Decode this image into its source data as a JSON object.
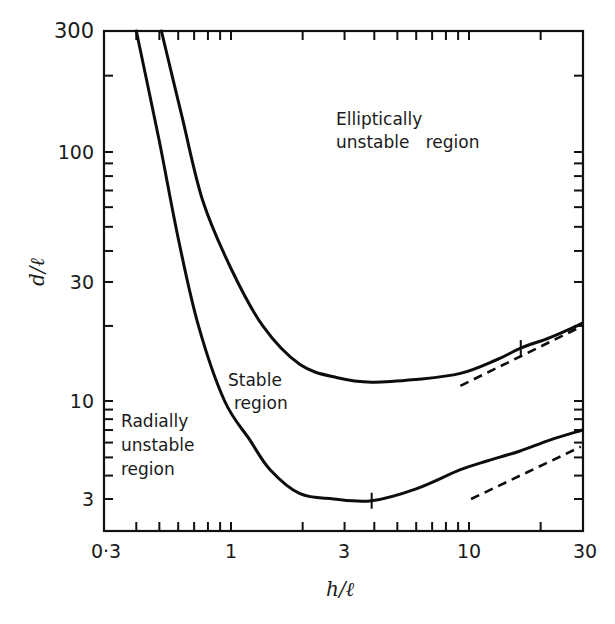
{
  "chart_data": {
    "type": "line",
    "title": "",
    "xlabel": "h/ℓ",
    "ylabel": "d/ℓ",
    "xscale": "log",
    "yscale": "log",
    "xlim": [
      0.3,
      30
    ],
    "ylim": [
      2.2,
      300
    ],
    "grid": false,
    "x_ticks": [
      {
        "value": 0.3,
        "label": "0·3"
      },
      {
        "value": 1,
        "label": "1"
      },
      {
        "value": 3,
        "label": "3"
      },
      {
        "value": 10,
        "label": "10"
      },
      {
        "value": 30,
        "label": "30"
      }
    ],
    "y_ticks": [
      {
        "value": 3,
        "label": "3"
      },
      {
        "value": 10,
        "label": "10"
      },
      {
        "value": 30,
        "label": "30"
      },
      {
        "value": 100,
        "label": "100"
      },
      {
        "value": 300,
        "label": "300"
      }
    ],
    "series": [
      {
        "name": "Elliptic stability boundary (upper curve)",
        "style": "solid",
        "x": [
          0.51,
          0.62,
          0.76,
          1.0,
          1.36,
          1.95,
          2.8,
          3.9,
          6.0,
          9.2,
          13.0,
          16.5,
          22.0,
          30.0
        ],
        "y": [
          300,
          140,
          64,
          34,
          20,
          14,
          12.4,
          11.9,
          12.2,
          12.9,
          14.6,
          16.3,
          18.0,
          20.5
        ],
        "marker_at": {
          "x": 16.5,
          "y": 16.3
        }
      },
      {
        "name": "Radial stability boundary (lower curve)",
        "style": "solid",
        "x": [
          0.4,
          0.5,
          0.6,
          0.73,
          0.94,
          1.2,
          1.46,
          1.95,
          2.7,
          3.9,
          6.0,
          9.2,
          12.0,
          16.3,
          22.0,
          30.0
        ],
        "y": [
          300,
          110,
          45,
          20,
          10,
          6.2,
          4.3,
          3.2,
          3.0,
          2.95,
          3.4,
          4.3,
          4.8,
          5.4,
          6.2,
          7.0
        ],
        "marker_at": {
          "x": 3.9,
          "y": 2.95
        }
      },
      {
        "name": "Upper asymptote",
        "style": "dashed",
        "x": [
          9.2,
          30.0
        ],
        "y": [
          11.5,
          20.0
        ]
      },
      {
        "name": "Lower asymptote",
        "style": "dashed",
        "x": [
          10.2,
          29.5
        ],
        "y": [
          3.0,
          5.7
        ]
      }
    ],
    "annotations": [
      {
        "text": [
          "Elliptically",
          "unstable region"
        ],
        "x": 4.5,
        "y": 110
      },
      {
        "text": [
          "Stable",
          "region"
        ],
        "x": 1.0,
        "y": 9
      },
      {
        "text": [
          "Radially",
          "unstable",
          "region"
        ],
        "x": 0.33,
        "y": 5
      }
    ]
  },
  "labels": {
    "x_axis_title": "h/ℓ",
    "y_axis_title": "d/ℓ",
    "x_tick_03": "0·3",
    "x_tick_1": "1",
    "x_tick_3": "3",
    "x_tick_10": "10",
    "x_tick_30": "30",
    "y_tick_3": "3",
    "y_tick_10": "10",
    "y_tick_30": "30",
    "y_tick_100": "100",
    "y_tick_300": "300",
    "elliptic_line1": "Elliptically",
    "elliptic_line2": "unstable   region",
    "stable_line1": "Stable",
    "stable_line2": "region",
    "radial_line1": "Radially",
    "radial_line2": "unstable",
    "radial_line3": "region"
  }
}
